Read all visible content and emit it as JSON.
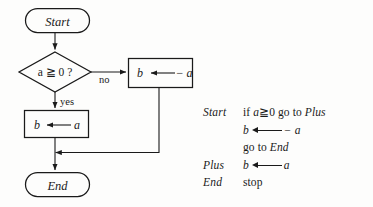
{
  "figure": {
    "kind": "flowchart-with-pseudocode",
    "line_color": "#1a1a1a",
    "background": "#fdfdfc"
  },
  "flowchart": {
    "nodes": [
      {
        "id": "start",
        "shape": "terminator",
        "label": "Start"
      },
      {
        "id": "decision",
        "shape": "diamond",
        "label": "a ≧ 0 ?"
      },
      {
        "id": "neg-assign",
        "shape": "process",
        "label_left": "b",
        "label_right": "− a",
        "arrow": "leftwards-arrow"
      },
      {
        "id": "pos-assign",
        "shape": "process",
        "label_left": "b",
        "label_right": "a",
        "arrow": "leftwards-arrow"
      },
      {
        "id": "end",
        "shape": "terminator",
        "label": "End"
      }
    ],
    "edge_labels": {
      "no": "no",
      "yes": "yes"
    }
  },
  "code": {
    "lines": [
      {
        "label": "Start",
        "parts": [
          {
            "t": "text",
            "v": "if "
          },
          {
            "t": "ital",
            "v": "a"
          },
          {
            "t": "text",
            "v": "≧0 go to "
          },
          {
            "t": "ital",
            "v": "Plus"
          }
        ]
      },
      {
        "label": "",
        "parts": [
          {
            "t": "ital",
            "v": "b"
          },
          {
            "t": "arrow"
          },
          {
            "t": "ital",
            "v": "− a"
          }
        ]
      },
      {
        "label": "",
        "parts": [
          {
            "t": "text",
            "v": "go to "
          },
          {
            "t": "ital",
            "v": "End"
          }
        ]
      },
      {
        "label": "Plus",
        "parts": [
          {
            "t": "ital",
            "v": "b"
          },
          {
            "t": "arrow"
          },
          {
            "t": "ital",
            "v": "a"
          }
        ]
      },
      {
        "label": "End",
        "parts": [
          {
            "t": "text",
            "v": "stop"
          }
        ]
      }
    ]
  }
}
